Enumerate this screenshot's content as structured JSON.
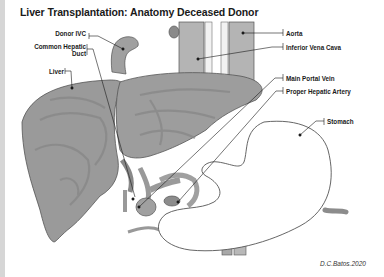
{
  "title": "Liver Transplantation: Anatomy Deceased Donor",
  "labels": {
    "donor_ivc": "Donor IVC",
    "common_hepatic_duct_line1": "Common Hepatic",
    "common_hepatic_duct_line2": "Duct",
    "liver": "Liver",
    "aorta": "Aorta",
    "inferior_vena_cava": "Inferior Vena Cava",
    "main_portal_vein": "Main Portal Vein",
    "proper_hepatic_artery": "Proper Hepatic Artery",
    "stomach": "Stomach"
  },
  "credit": "D.C.Batos.2020",
  "colors": {
    "liver_fill": "#9a9a9a",
    "liver_vein": "#868686",
    "vessel_fill": "#b4b4b4",
    "stomach_fill": "#ffffff",
    "outline": "#555555",
    "leader_line": "#1a1a1a",
    "left_strip": "#d6d6d6"
  }
}
